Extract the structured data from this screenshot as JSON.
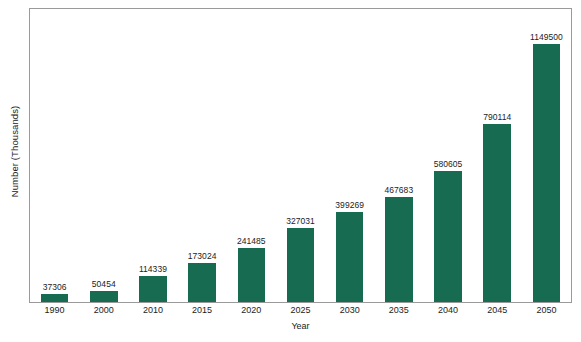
{
  "chart_data": {
    "type": "bar",
    "title": "",
    "xlabel": "Year",
    "ylabel": "Number (Thousands)",
    "categories": [
      "1990",
      "2000",
      "2010",
      "2015",
      "2020",
      "2025",
      "2030",
      "2035",
      "2040",
      "2045",
      "2050"
    ],
    "values": [
      37306,
      50454,
      114339,
      173024,
      241485,
      327031,
      399269,
      467683,
      580605,
      790114,
      1149500
    ],
    "value_labels": [
      "37306",
      "50454",
      "114339",
      "173024",
      "241485",
      "327031",
      "399269",
      "467683",
      "580605",
      "790114",
      "1149500"
    ],
    "series": [
      {
        "name": "Number (Thousands)",
        "values": [
          37306,
          50454,
          114339,
          173024,
          241485,
          327031,
          399269,
          467683,
          580605,
          790114,
          1149500
        ]
      }
    ],
    "ylim": [
      0,
      1250000
    ],
    "axis_ticks_visible": false,
    "grid": false,
    "legend": false,
    "legend_position": "none",
    "bar_color": "#176b51",
    "frame_color": "#9a9a9a",
    "background_color": "#ffffff",
    "label_color": "#1c1c1c"
  }
}
